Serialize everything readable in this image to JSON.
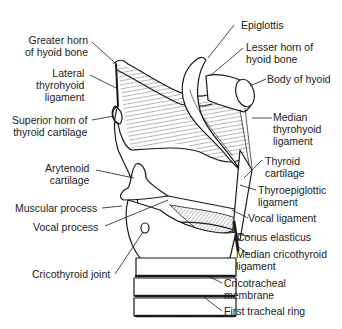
{
  "diagram": {
    "labels": {
      "greater_horn": [
        "Greater horn",
        "of hyoid bone"
      ],
      "lateral_thyrohyoid": [
        "Lateral",
        "thyrohyoid",
        "ligament"
      ],
      "superior_horn": [
        "Superior horn of",
        "thyroid cartilage"
      ],
      "arytenoid": [
        "Arytenoid",
        "cartilage"
      ],
      "muscular_process": [
        "Muscular process"
      ],
      "vocal_process": [
        "Vocal process"
      ],
      "cricothyroid_joint": [
        "Cricothyroid joint"
      ],
      "epiglottis": [
        "Epiglottis"
      ],
      "lesser_horn": [
        "Lesser horn of",
        "hyoid bone"
      ],
      "body_of_hyoid": [
        "Body of hyoid"
      ],
      "median_thyrohyoid": [
        "Median",
        "thyrohyoid",
        "ligament"
      ],
      "thyroid_cartilage": [
        "Thyroid",
        "cartilage"
      ],
      "thyroepiglottic": [
        "Thyroepiglottic",
        "ligament"
      ],
      "vocal_ligament": [
        "Vocal ligament"
      ],
      "conus_elasticus": [
        "Conus elasticus"
      ],
      "median_cricothyroid": [
        "Median cricothyroid",
        "ligament"
      ],
      "cricotracheal": [
        "Cricotracheal",
        "membrane"
      ],
      "first_tracheal_ring": [
        "First tracheal ring"
      ]
    }
  }
}
